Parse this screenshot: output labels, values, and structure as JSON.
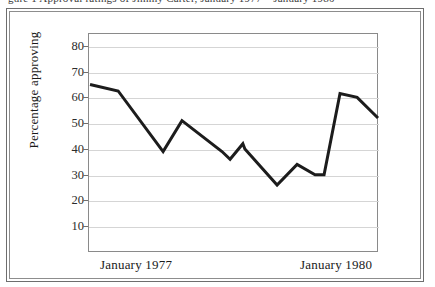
{
  "top_sliver": {
    "text": "gure 1   Approval ratings of Jimmy Carter, January 1977 – January 1980"
  },
  "chart_data": {
    "type": "line",
    "title": "",
    "xlabel": "",
    "ylabel": "Percentage approving",
    "ylim": [
      0,
      85
    ],
    "yticks": [
      10,
      20,
      30,
      40,
      50,
      60,
      70,
      80
    ],
    "ytick_labels": [
      "10",
      "20",
      "30",
      "40",
      "50",
      "60",
      "70",
      "80"
    ],
    "xtick_labels": [
      "January 1977",
      "January 1980"
    ],
    "xtick_positions": [
      0.13,
      0.85
    ],
    "grid": "horizontal",
    "legend": "none",
    "series": [
      {
        "name": "Percentage approving",
        "color": "#1c1c1c",
        "line_width": 3,
        "x": [
          0.007,
          0.104,
          0.259,
          0.324,
          0.462,
          0.49,
          0.534,
          0.541,
          0.652,
          0.721,
          0.783,
          0.814,
          0.869,
          0.928,
          1.0
        ],
        "values": [
          65,
          62.5,
          39,
          51,
          39,
          36,
          42,
          40,
          26,
          34,
          30,
          30,
          61.5,
          60,
          52
        ]
      }
    ]
  },
  "frame": {
    "outer_border_color": "#6e6e6e",
    "inner_border_color": "#8d8d8d",
    "plot_border_color": "#8a8a8a",
    "gridline_color": "#d5d5d5",
    "background": "#ffffff"
  }
}
